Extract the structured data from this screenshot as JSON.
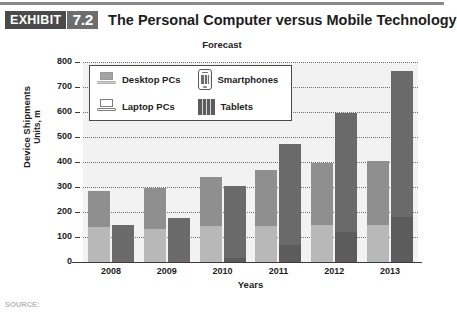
{
  "exhibit": {
    "tag": "EXHIBIT",
    "number": "7.2",
    "title": "The Personal Computer versus Mobile Technology"
  },
  "source": {
    "label": "SOURCE:"
  },
  "chart_data": {
    "type": "bar",
    "title": "Forecast",
    "xlabel": "Years",
    "ylabel": "Device Shipments",
    "ylabel_sub": "Units, m",
    "ylim": [
      0,
      800
    ],
    "ytick_step": 100,
    "yticks": [
      "800",
      "700",
      "600",
      "500",
      "400",
      "300",
      "200",
      "100",
      "0"
    ],
    "grid": true,
    "grid_style": "dotted-horizontal",
    "legend_position": "inside-top-left",
    "stacked": true,
    "categories": [
      "2008",
      "2009",
      "2010",
      "2011",
      "2012",
      "2013"
    ],
    "bar_groups": [
      {
        "name": "PC",
        "segments": [
          "Laptop PCs",
          "Desktop PCs"
        ]
      },
      {
        "name": "Mobile",
        "segments": [
          "Tablets",
          "Smartphones"
        ]
      }
    ],
    "series": [
      {
        "name": "Laptop PCs",
        "color": "#b8b8b8",
        "stack": "PC",
        "values": [
          140,
          132,
          143,
          145,
          150,
          150
        ]
      },
      {
        "name": "Desktop PCs",
        "color": "#8f8f8f",
        "stack": "PC",
        "values": [
          145,
          166,
          197,
          222,
          245,
          255
        ]
      },
      {
        "name": "Tablets",
        "color": "#5c5c5c",
        "stack": "Mobile",
        "values": [
          0,
          0,
          18,
          68,
          120,
          180
        ]
      },
      {
        "name": "Smartphones",
        "color": "#6a6a6a",
        "stack": "Mobile",
        "values": [
          150,
          178,
          288,
          405,
          475,
          585
        ]
      }
    ],
    "stack_totals": [
      {
        "category": "2008",
        "pc_total": 285,
        "mobile_total": 150
      },
      {
        "category": "2009",
        "pc_total": 298,
        "mobile_total": 178
      },
      {
        "category": "2010",
        "pc_total": 340,
        "mobile_total": 306
      },
      {
        "category": "2011",
        "pc_total": 367,
        "mobile_total": 473
      },
      {
        "category": "2012",
        "pc_total": 395,
        "mobile_total": 595
      },
      {
        "category": "2013",
        "pc_total": 405,
        "mobile_total": 765
      }
    ],
    "legend": [
      {
        "key": "desktop",
        "label": "Desktop PCs",
        "icon": "desktop-pc-icon",
        "color": "#8f8f8f"
      },
      {
        "key": "phone",
        "label": "Smartphones",
        "icon": "smartphone-icon",
        "color": "#6a6a6a"
      },
      {
        "key": "laptop",
        "label": "Laptop PCs",
        "icon": "laptop-pc-icon",
        "color": "#b8b8b8"
      },
      {
        "key": "tablet",
        "label": "Tablets",
        "icon": "tablet-icon",
        "color": "#5c5c5c"
      }
    ]
  }
}
